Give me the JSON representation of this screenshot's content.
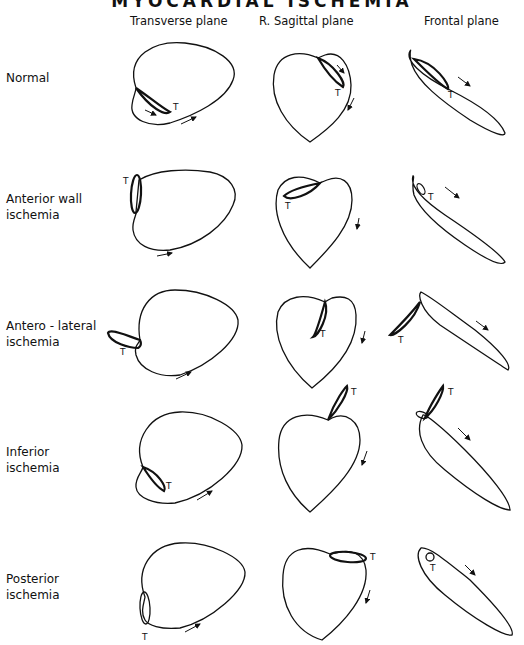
{
  "title": "MYOCARDIAL ISCHEMIA",
  "columns": [
    "Transverse plane",
    "R. Sagittal plane",
    "Frontal plane"
  ],
  "rows": [
    {
      "label_line1": "Normal",
      "label_line2": ""
    },
    {
      "label_line1": "Anterior wall",
      "label_line2": "ischemia"
    },
    {
      "label_line1": "Antero - lateral",
      "label_line2": "ischemia"
    },
    {
      "label_line1": "Inferior",
      "label_line2": "ischemia"
    },
    {
      "label_line1": "Posterior",
      "label_line2": "ischemia"
    }
  ],
  "loop_marker": "T"
}
